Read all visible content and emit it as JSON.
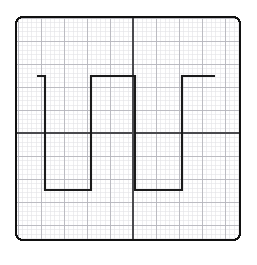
{
  "figure": {
    "background_color": "#ffffff"
  },
  "frame": {
    "name": "plot-border",
    "x": 16,
    "y": 17,
    "width": 224,
    "height": 223,
    "corner_radius": 7,
    "stroke_color": "#111111",
    "stroke_width": 2.2
  },
  "grid": {
    "minor": {
      "spacing": 4.6,
      "color": "#e2e2e6",
      "width": 0.6
    },
    "major": {
      "spacing": 23,
      "color": "#b6b6bc",
      "width": 0.9
    },
    "axes": {
      "color": "#4a4a4e",
      "width": 1.5,
      "x_center": 133,
      "y_center": 133
    }
  },
  "chart_data": {
    "type": "line",
    "xlabel": "",
    "ylabel": "",
    "xlim": [
      16,
      240
    ],
    "ylim": [
      240,
      17
    ],
    "grid": true,
    "legend": null,
    "series": [
      {
        "name": "square-wave-trace",
        "color": "#1a1a1a",
        "width": 2.1,
        "high_level_y": 76,
        "low_level_y": 190,
        "x": [
          37,
          45,
          45,
          91,
          91,
          135,
          135,
          182,
          182,
          215
        ],
        "y": [
          76,
          76,
          190,
          190,
          76,
          76,
          190,
          190,
          76,
          76
        ],
        "points": [
          {
            "x": 37,
            "y": 76,
            "label": "start-high-stub"
          },
          {
            "x": 45,
            "y": 76,
            "label": "falling-edge-1-top"
          },
          {
            "x": 45,
            "y": 190,
            "label": "falling-edge-1-bottom"
          },
          {
            "x": 91,
            "y": 190,
            "label": "trough-1-end"
          },
          {
            "x": 91,
            "y": 76,
            "label": "rising-edge-1-top"
          },
          {
            "x": 135,
            "y": 76,
            "label": "peak-1-end"
          },
          {
            "x": 135,
            "y": 190,
            "label": "falling-edge-2-bottom"
          },
          {
            "x": 182,
            "y": 190,
            "label": "trough-2-end"
          },
          {
            "x": 182,
            "y": 76,
            "label": "rising-edge-2-top"
          },
          {
            "x": 215,
            "y": 76,
            "label": "end-high-stub"
          }
        ]
      }
    ]
  }
}
